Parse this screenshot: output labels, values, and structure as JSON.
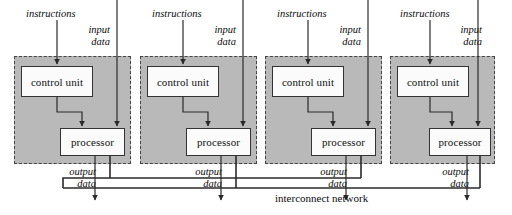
{
  "diagram": {
    "title": "interconnect network",
    "bus_label": "interconnect network",
    "colors": {
      "panel_fill": "#b9b9b9",
      "panel_border": "#444444",
      "box_fill": "#fbfbfb",
      "box_border": "#333333",
      "line": "#2a2a2a",
      "background": "#ffffff"
    },
    "unit_count": 4,
    "labels": {
      "instructions": "instructions",
      "input_line1": "input",
      "input_line2": "data",
      "output_line1": "output",
      "output_line2": "data",
      "control_unit": "control unit",
      "processor": "processor"
    },
    "units": [
      {
        "index": 1,
        "instructions": "instructions",
        "input_line1": "input",
        "input_line2": "data",
        "output_line1": "output",
        "output_line2": "data",
        "control_unit": "control unit",
        "processor": "processor"
      },
      {
        "index": 2,
        "instructions": "instructions",
        "input_line1": "input",
        "input_line2": "data",
        "output_line1": "output",
        "output_line2": "data",
        "control_unit": "control unit",
        "processor": "processor"
      },
      {
        "index": 3,
        "instructions": "instructions",
        "input_line1": "input",
        "input_line2": "data",
        "output_line1": "output",
        "output_line2": "data",
        "control_unit": "control unit",
        "processor": "processor"
      },
      {
        "index": 4,
        "instructions": "instructions",
        "input_line1": "input",
        "input_line2": "data",
        "output_line1": "output",
        "output_line2": "data",
        "control_unit": "control unit",
        "processor": "processor"
      }
    ]
  }
}
